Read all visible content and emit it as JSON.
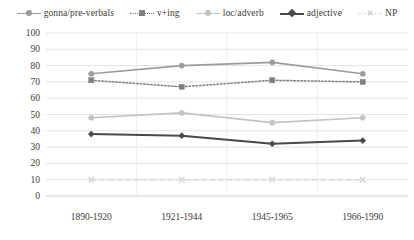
{
  "chart_data": {
    "type": "line",
    "title": "",
    "xlabel": "",
    "ylabel": "",
    "categories": [
      "1890-1920",
      "1921-1944",
      "1945-1965",
      "1966-1990"
    ],
    "ylim": [
      0,
      100
    ],
    "yticks": [
      0,
      10,
      20,
      30,
      40,
      50,
      60,
      70,
      80,
      90,
      100
    ],
    "grid": true,
    "legend_position": "top",
    "series": [
      {
        "name": "gonna/pre-verbals",
        "values": [
          75,
          80,
          82,
          75
        ],
        "color": "#9b9b9b",
        "marker": "circle",
        "dash": "solid",
        "width": 1.6
      },
      {
        "name": "v+ing",
        "values": [
          71,
          67,
          71,
          70
        ],
        "color": "#808080",
        "marker": "square",
        "dash": "dotted",
        "width": 1.5
      },
      {
        "name": "loc/adverb",
        "values": [
          48,
          51,
          45,
          48
        ],
        "color": "#c3c3c3",
        "marker": "circle",
        "dash": "solid",
        "width": 1.6
      },
      {
        "name": "adjective",
        "values": [
          38,
          37,
          32,
          34
        ],
        "color": "#4a4a4a",
        "marker": "diamond",
        "dash": "solid",
        "width": 2.0
      },
      {
        "name": "NP",
        "values": [
          10,
          10,
          10,
          10
        ],
        "color": "#d8d8d8",
        "marker": "x",
        "dash": "dashed",
        "width": 1.4
      }
    ]
  },
  "axes": {
    "ytick_labels": [
      "100",
      "90",
      "80",
      "70",
      "60",
      "50",
      "40",
      "30",
      "20",
      "10",
      "0"
    ],
    "xtick_labels": [
      "1890-1920",
      "1921-1944",
      "1945-1965",
      "1966-1990"
    ]
  },
  "legend": {
    "items": [
      {
        "label": "gonna/pre-verbals"
      },
      {
        "label": "v+ing"
      },
      {
        "label": "loc/adverb"
      },
      {
        "label": "adjective"
      },
      {
        "label": "NP"
      }
    ]
  },
  "style": {
    "grid_color": "#e4e4e4",
    "text_color": "#3b3b3b",
    "background": "#ffffff"
  }
}
